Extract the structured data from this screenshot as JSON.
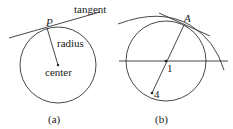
{
  "figures": [
    {
      "id": "a",
      "caption": "(a)",
      "labels": {
        "point": "P",
        "tangent": "tangent",
        "radius": "radius",
        "center": "center"
      }
    },
    {
      "id": "b",
      "caption": "(b)",
      "labels": {
        "point": "A",
        "center": "1",
        "other_point": "4"
      }
    }
  ]
}
